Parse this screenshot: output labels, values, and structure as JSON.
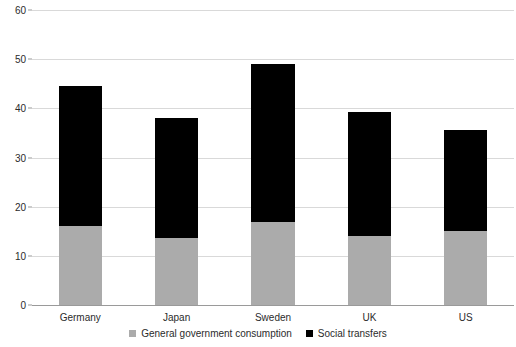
{
  "chart_data": {
    "type": "bar",
    "subtype": "stacked-vertical",
    "title": "",
    "subtitle": "",
    "xlabel": "",
    "ylabel": "",
    "categories": [
      "Germany",
      "Japan",
      "Sweden",
      "UK",
      "US"
    ],
    "series": [
      {
        "name": "General government consumption",
        "color": "#ababab",
        "values": [
          16.0,
          13.7,
          16.8,
          14.0,
          15.0
        ]
      },
      {
        "name": "Social transfers",
        "color": "#000000",
        "values": [
          28.5,
          24.3,
          32.2,
          25.3,
          20.6
        ]
      }
    ],
    "totals": [
      44.5,
      38.0,
      49.0,
      39.3,
      35.6
    ],
    "ylim": [
      0,
      60
    ],
    "yticks": [
      0,
      10,
      20,
      30,
      40,
      50,
      60
    ],
    "ytick_labels": [
      "0",
      "10",
      "20",
      "30",
      "40",
      "50",
      "60"
    ],
    "grid": true,
    "grid_axis": "y",
    "grid_color": "#d9d9d9",
    "legend_position": "bottom",
    "background_color": "#ffffff",
    "axis_color": "#9a9a9a",
    "text_color": "#2b2b2b"
  },
  "legend": {
    "items": [
      {
        "label": "General government consumption",
        "color": "#ababab",
        "swatch_name": "legend-swatch-general-government-consumption"
      },
      {
        "label": "Social transfers",
        "color": "#000000",
        "swatch_name": "legend-swatch-social-transfers"
      }
    ]
  }
}
